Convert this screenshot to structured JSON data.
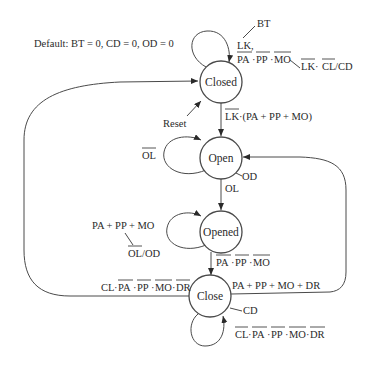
{
  "diagram": {
    "type": "state-machine",
    "default_note": "Default: BT = 0, CD = 0, OD = 0",
    "states": [
      {
        "id": "closed",
        "label": "Closed"
      },
      {
        "id": "open",
        "label": "Open"
      },
      {
        "id": "opened",
        "label": "Opened"
      },
      {
        "id": "close",
        "label": "Close"
      }
    ],
    "transitions": [
      {
        "from": "closed",
        "to": "closed",
        "condition": "LK, PA·PP·MO (overbars on PA, PP, MO)",
        "output_bt": "BT",
        "output_lkcl": "LK·CL/CD (overbars on LK, CL)"
      },
      {
        "from": "reset",
        "to": "closed",
        "condition": "Reset"
      },
      {
        "from": "closed",
        "to": "open",
        "condition": "LK·(PA + PP + MO) (overbar on LK)"
      },
      {
        "from": "open",
        "to": "open",
        "condition": "OL (overbar)"
      },
      {
        "from": "open",
        "to": "opened",
        "condition": "OL",
        "output": "OD"
      },
      {
        "from": "opened",
        "to": "opened",
        "condition": "PA + PP + MO",
        "output": "OL/OD (overbar on OL)"
      },
      {
        "from": "opened",
        "to": "close",
        "condition": "PA·PP·MO (all overbars)"
      },
      {
        "from": "close",
        "to": "open",
        "condition": "PA + PP + MO + DR"
      },
      {
        "from": "close",
        "to": "closed",
        "condition": "CL·PA·PP·MO·DR (overbars on PA, PP, MO, DR)"
      },
      {
        "from": "close",
        "to": "close",
        "condition": "CL·PA·PP·MO·DR (all overbars)",
        "output": "CD"
      }
    ]
  },
  "labels": {
    "default": "Default: BT = 0, CD = 0, OD = 0",
    "closed": "Closed",
    "open": "Open",
    "opened": "Opened",
    "close": "Close",
    "bt": "BT",
    "lk_comma": "LK,",
    "pa": "PA",
    "pp": "PP",
    "mo": "MO",
    "dot": "·",
    "lk": "LK",
    "cl": "CL",
    "slash_cd": "/CD",
    "reset": "Reset",
    "lk_paren": "·(PA + PP + MO)",
    "ol": "OL",
    "od": "OD",
    "pa_pp_mo_sum": "PA + PP + MO",
    "ol_od_slash": "/OD",
    "close_to_open": "PA + PP + MO + DR",
    "cd": "CD",
    "dr": "DR"
  }
}
